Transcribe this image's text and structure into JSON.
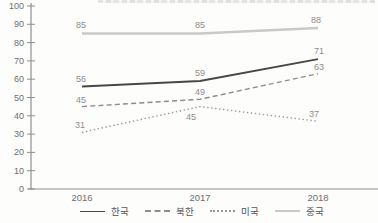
{
  "chart_data": {
    "type": "line",
    "categories": [
      "2016",
      "2017",
      "2018"
    ],
    "series": [
      {
        "key": "korea",
        "name": "한국",
        "values": [
          56,
          59,
          71
        ],
        "style": "solid",
        "color": "#474747",
        "width": 1.8,
        "label_offsets": [
          [
            -1,
            -5
          ],
          [
            0,
            -5
          ],
          [
            1,
            -5
          ]
        ]
      },
      {
        "key": "north-korea",
        "name": "북한",
        "values": [
          45,
          49,
          63
        ],
        "style": "dashed",
        "color": "#8d8d8d",
        "width": 1.4,
        "label_offsets": [
          [
            -1,
            -4
          ],
          [
            0,
            -4
          ],
          [
            1,
            -4
          ]
        ]
      },
      {
        "key": "usa",
        "name": "미국",
        "values": [
          31,
          45,
          37
        ],
        "style": "dotted",
        "color": "#979797",
        "width": 1.4,
        "label_offsets": [
          [
            -2,
            -4
          ],
          [
            -9,
            13
          ],
          [
            -4,
            -4
          ]
        ]
      },
      {
        "key": "china",
        "name": "중국",
        "values": [
          85,
          85,
          88
        ],
        "style": "solid",
        "color": "#c9c9c9",
        "width": 2.4,
        "label_offsets": [
          [
            -1,
            -5
          ],
          [
            0,
            -5
          ],
          [
            -2,
            -5
          ]
        ]
      }
    ],
    "title": "",
    "xlabel": "",
    "ylabel": "",
    "ylim": [
      0,
      100
    ],
    "ytick_step": 10,
    "grid": false,
    "legend_position": "bottom",
    "colors": {
      "axis": "#8f8f8f",
      "tick_label": "#6e6e6e",
      "category_label": "#6e6e6e",
      "data_label": "#8c8c8c",
      "legend_text": "#555555"
    }
  }
}
